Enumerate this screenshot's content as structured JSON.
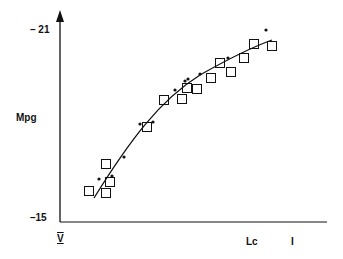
{
  "chart_data": {
    "type": "scatter",
    "title": "",
    "xlabel": "Lc",
    "ylabel": "Mpg",
    "x_tick_labels": [
      "V",
      "I"
    ],
    "y_tick_labels": [
      "-15",
      "-21"
    ],
    "ylim": [
      -15,
      -21
    ],
    "grid": false,
    "legend": "none",
    "series": [
      {
        "name": "squares",
        "marker": "open-square",
        "points_px": [
          [
            89,
            191
          ],
          [
            106,
            164
          ],
          [
            110,
            182
          ],
          [
            106,
            193
          ],
          [
            147,
            127
          ],
          [
            164,
            100
          ],
          [
            182,
            99
          ],
          [
            187,
            88
          ],
          [
            197,
            89
          ],
          [
            211,
            78
          ],
          [
            220,
            63
          ],
          [
            231,
            72
          ],
          [
            244,
            58
          ],
          [
            254,
            44
          ],
          [
            272,
            46
          ]
        ]
      },
      {
        "name": "dots",
        "marker": "filled-dot",
        "points_px": [
          [
            99,
            179
          ],
          [
            112,
            176
          ],
          [
            124,
            157
          ],
          [
            140,
            124
          ],
          [
            153,
            122
          ],
          [
            175,
            90
          ],
          [
            185,
            81
          ],
          [
            188,
            79
          ],
          [
            200,
            74
          ],
          [
            228,
            58
          ],
          [
            266,
            30
          ]
        ]
      },
      {
        "name": "fit",
        "type": "line",
        "path_px": "M94,198 C130,140 160,100 200,75 C230,58 250,48 272,40"
      }
    ]
  },
  "labels": {
    "y_top": "– 21",
    "y_bottom": "–15",
    "y_axis": "Mpg",
    "x_axis": "Lc",
    "x_left": "V",
    "x_right": "I"
  }
}
